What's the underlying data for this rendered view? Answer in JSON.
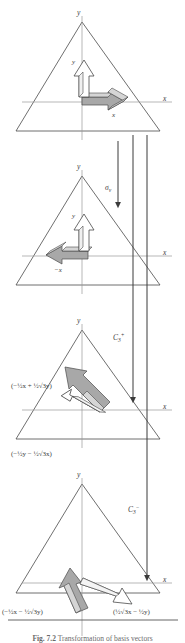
{
  "figure": {
    "caption_label": "Fig. 7.2",
    "caption_text": "Transformation of basis vectors",
    "panels": [
      {
        "id": "panel-identity",
        "operation": "E",
        "axis_y_label": "y",
        "axis_x_label": "x",
        "vector_y_label": "y",
        "vector_x_label": "x",
        "vectors": [
          {
            "name": "y-basis-vector",
            "label": "y",
            "direction": "up",
            "fill": "#ffffff"
          },
          {
            "name": "x-basis-vector",
            "label": "x",
            "direction": "right",
            "fill": "#9a9a9a"
          }
        ]
      },
      {
        "id": "panel-sigma-v",
        "operation": "σ",
        "operation_sub": "v",
        "axis_y_label": "y",
        "axis_x_label": "x",
        "vector_y_label": "y",
        "vector_x_label": "−x",
        "vectors": [
          {
            "name": "y-basis-vector",
            "label": "y",
            "direction": "up",
            "fill": "#ffffff"
          },
          {
            "name": "x-basis-vector",
            "label": "−x",
            "direction": "left",
            "fill": "#9a9a9a"
          }
        ]
      },
      {
        "id": "panel-c3-plus",
        "operation": "C",
        "operation_sub": "3",
        "operation_sup": "+",
        "axis_y_label": "y",
        "axis_x_label": "x",
        "label_upper": "(−½x + ½√3y)",
        "label_lower": "(−½y − ½√3x)",
        "vectors": [
          {
            "name": "rotated-shaded-vector",
            "direction": "up-left",
            "fill": "#9a9a9a"
          },
          {
            "name": "rotated-open-vector",
            "direction": "down-left",
            "fill": "#ffffff"
          }
        ]
      },
      {
        "id": "panel-c3-minus",
        "operation": "C",
        "operation_sub": "3",
        "operation_sup": "−",
        "axis_x_label": "x",
        "axis_y_label": "y",
        "label_left": "(−½x − ½√3y)",
        "label_right": "(½√3x − ½y)",
        "vectors": [
          {
            "name": "rotated-shaded-vector",
            "direction": "up-right-steep",
            "fill": "#9a9a9a"
          },
          {
            "name": "rotated-open-vector",
            "direction": "down-right",
            "fill": "#ffffff"
          }
        ]
      }
    ],
    "operator_arrows": [
      {
        "name": "sigma-v-operator-arrow",
        "label": "σ",
        "sub": "v"
      },
      {
        "name": "c3-plus-operator-arrow",
        "label": "C",
        "sub": "3",
        "sup": "+"
      },
      {
        "name": "c3-minus-operator-arrow",
        "label": "C",
        "sub": "3",
        "sup": "−"
      }
    ],
    "colors": {
      "ink": "#3b3b3b",
      "axis": "#8d8d8d",
      "shaded_vector": "#9a9a9a",
      "open_vector": "#ffffff",
      "caption": "#6a6a6a"
    }
  }
}
